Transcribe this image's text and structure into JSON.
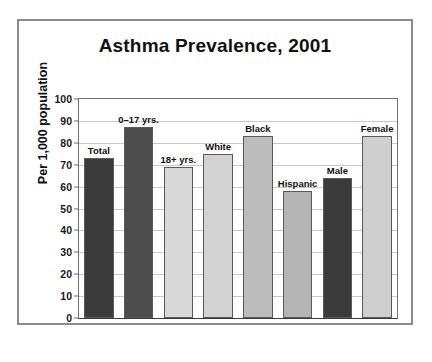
{
  "chart_data": {
    "type": "bar",
    "title": "Asthma Prevalence, 2001",
    "xlabel": "",
    "ylabel": "Per 1,000 population",
    "ylim": [
      0,
      100
    ],
    "ytick_values": [
      0,
      10,
      20,
      30,
      40,
      50,
      60,
      70,
      80,
      90,
      100
    ],
    "ytick_labels": [
      "0",
      "10",
      "20",
      "30",
      "40",
      "50",
      "60",
      "70",
      "80",
      "90",
      "100"
    ],
    "grid": true,
    "legend": "none",
    "categories": [
      "Total",
      "0–17 yrs.",
      "18+ yrs.",
      "White",
      "Black",
      "Hispanic",
      "Male",
      "Female"
    ],
    "values": [
      73,
      87,
      69,
      75,
      83,
      58,
      64,
      83
    ],
    "bar_colors": [
      "#3b3b3b",
      "#4d4d4d",
      "#d9d9d9",
      "#d2d2d2",
      "#bcbcbc",
      "#b4b4b4",
      "#3b3b3b",
      "#cfcfcf"
    ],
    "bars": [
      {
        "label": "Total",
        "value": 73,
        "color": "#3b3b3b"
      },
      {
        "label": "0–17 yrs.",
        "value": 87,
        "color": "#4d4d4d"
      },
      {
        "label": "18+ yrs.",
        "value": 69,
        "color": "#d9d9d9"
      },
      {
        "label": "White",
        "value": 75,
        "color": "#d2d2d2"
      },
      {
        "label": "Black",
        "value": 83,
        "color": "#bcbcbc"
      },
      {
        "label": "Hispanic",
        "value": 58,
        "color": "#b4b4b4"
      },
      {
        "label": "Male",
        "value": 64,
        "color": "#3b3b3b"
      },
      {
        "label": "Female",
        "value": 83,
        "color": "#cfcfcf"
      }
    ]
  },
  "colors": {
    "frame_border": "#8b8b8b",
    "axis": "#6f6f6f",
    "gridline": "#c9c9c9",
    "text": "#111111",
    "background": "#ffffff"
  }
}
